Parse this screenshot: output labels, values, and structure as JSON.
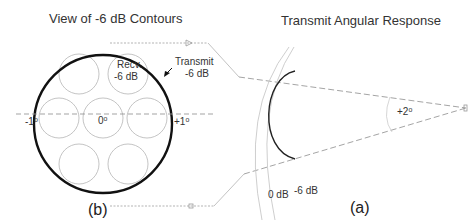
{
  "left_panel": {
    "title": "View of -6 dB Contours",
    "panel_label": "(b)",
    "recv_label_line1": "Recv.",
    "recv_label_line2": "-6 dB",
    "transmit_label_line1": "Transmit",
    "transmit_label_line2": "-6 dB",
    "axis_left": "-1",
    "axis_center": "0",
    "axis_right": "+1",
    "degree": "o",
    "recv_beam_count": 7
  },
  "right_panel": {
    "title": "Transmit Angular Response",
    "panel_label": "(a)",
    "angle_label": "+2",
    "degree": "o",
    "contour_0db": "0 dB",
    "contour_6db": "-6 dB"
  },
  "colors": {
    "outline": "#111111",
    "recv_circles": "#b8b8b8",
    "dashed": "#9a9a9a",
    "text": "#333333"
  }
}
